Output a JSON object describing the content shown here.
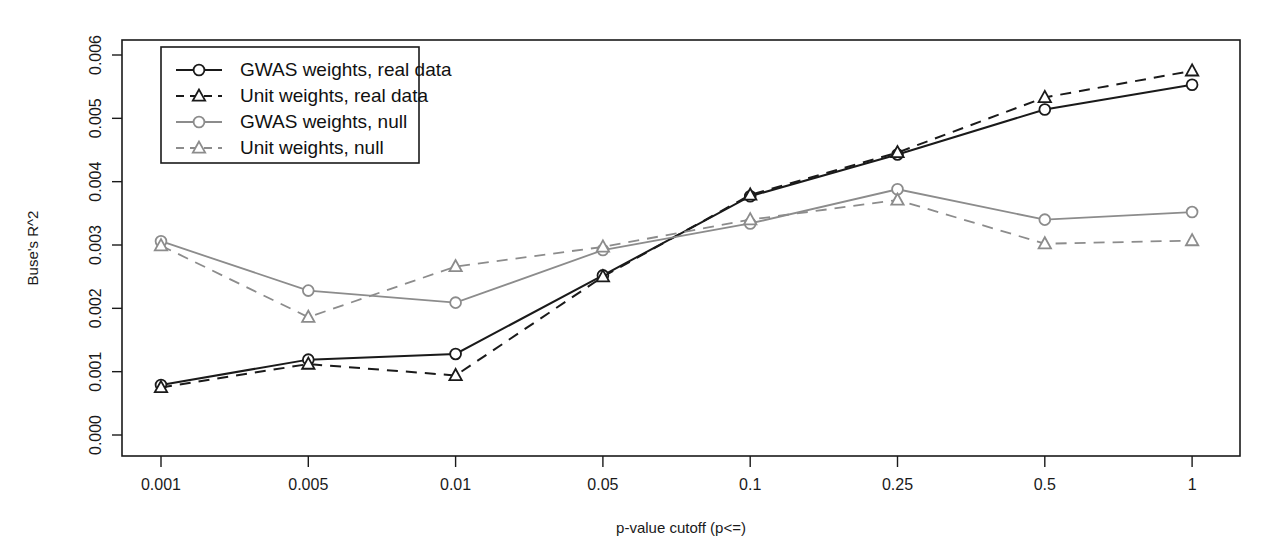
{
  "chart_data": {
    "type": "line",
    "title": "",
    "xlabel": "p-value cutoff (p<=)",
    "ylabel": "Buse's R^2",
    "categories": [
      "0.001",
      "0.005",
      "0.01",
      "0.05",
      "0.1",
      "0.25",
      "0.5",
      "1"
    ],
    "x_tick_labels": [
      "0.001",
      "0.005",
      "0.01",
      "0.05",
      "0.1",
      "0.25",
      "0.5",
      "1"
    ],
    "y_tick_labels": [
      "0.000",
      "0.001",
      "0.002",
      "0.003",
      "0.004",
      "0.005",
      "0.006"
    ],
    "y_tick_values": [
      0.0,
      0.001,
      0.002,
      0.003,
      0.004,
      0.005,
      0.006
    ],
    "ylim": [
      0.0,
      0.006
    ],
    "grid": false,
    "legend_position": "top-left",
    "series": [
      {
        "name": "GWAS weights, real data",
        "marker": "circle",
        "dash": "solid",
        "color": "#1a1a1a",
        "values": [
          0.00079,
          0.00119,
          0.00128,
          0.00252,
          0.00377,
          0.00443,
          0.00514,
          0.00553
        ]
      },
      {
        "name": "Unit weights, real data",
        "marker": "triangle",
        "dash": "dashed",
        "color": "#1a1a1a",
        "values": [
          0.00075,
          0.00112,
          0.00094,
          0.0025,
          0.00379,
          0.00446,
          0.00533,
          0.00575
        ]
      },
      {
        "name": "GWAS weights, null",
        "marker": "circle",
        "dash": "solid",
        "color": "#8c8c8c",
        "values": [
          0.00306,
          0.00228,
          0.00209,
          0.00292,
          0.00334,
          0.00388,
          0.0034,
          0.00352
        ]
      },
      {
        "name": "Unit weights, null",
        "marker": "triangle",
        "dash": "dashed",
        "color": "#8c8c8c",
        "values": [
          0.00299,
          0.00186,
          0.00266,
          0.00297,
          0.0034,
          0.00371,
          0.00302,
          0.00307
        ]
      }
    ]
  },
  "legend": {
    "items": [
      {
        "label": "GWAS weights, real data"
      },
      {
        "label": "Unit weights, real data"
      },
      {
        "label": "GWAS weights, null"
      },
      {
        "label": "Unit weights, null"
      }
    ]
  },
  "colors": {
    "real_data": "#1a1a1a",
    "null_data": "#8c8c8c",
    "background": "#ffffff",
    "axis": "#1a1a1a"
  }
}
